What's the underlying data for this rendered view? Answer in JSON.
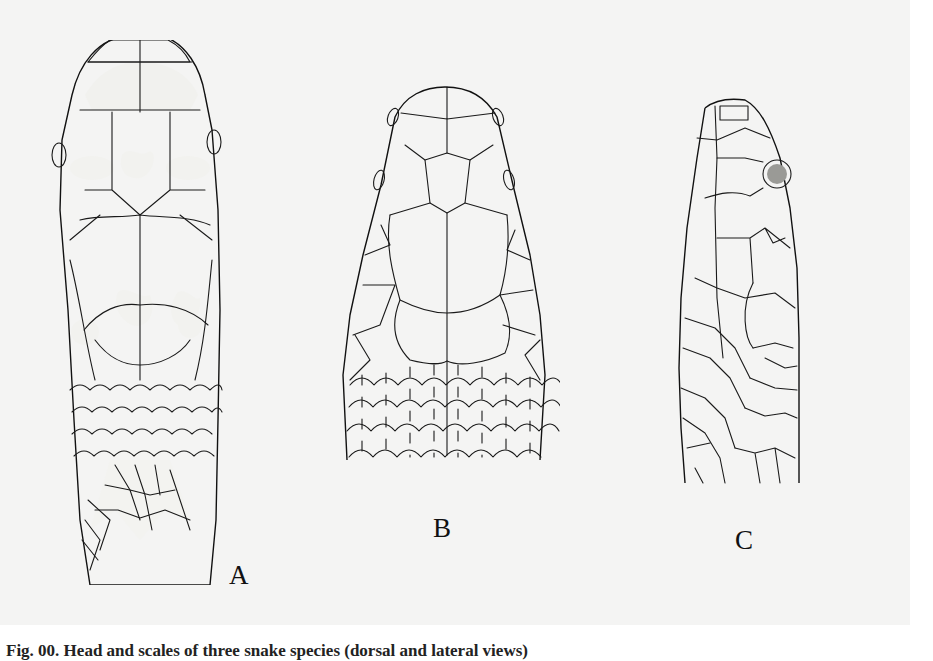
{
  "figure": {
    "panels": [
      {
        "id": "A",
        "label": "A",
        "description": "Dorsal view of snake head, stippled pattern with pale blotches"
      },
      {
        "id": "B",
        "label": "B",
        "description": "Dorsal view of snake head, scale outline"
      },
      {
        "id": "C",
        "label": "C",
        "description": "Lateral view of snake head, scale outline"
      }
    ],
    "caption_partial": "Fig. 00. Head and scales of three snake species (dorsal and lateral views)",
    "colors": {
      "plate_background": "#f4f4f3",
      "page_background": "#ffffff",
      "ink": "#1a1a1a"
    }
  }
}
